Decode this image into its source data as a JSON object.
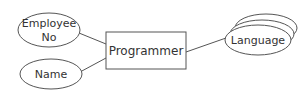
{
  "diagram": {
    "type": "er-diagram",
    "entity": {
      "label": "Programmer"
    },
    "attributes": [
      {
        "id": "employee-no",
        "label_line1": "Employee",
        "label_line2": "No",
        "kind": "attribute"
      },
      {
        "id": "name",
        "label": "Name",
        "kind": "attribute"
      },
      {
        "id": "language",
        "label": "Language",
        "kind": "multivalued-attribute"
      }
    ],
    "connections": [
      {
        "from": "Employee No",
        "to": "Programmer"
      },
      {
        "from": "Name",
        "to": "Programmer"
      },
      {
        "from": "Programmer",
        "to": "Language"
      }
    ],
    "colors": {
      "stroke": "#555555",
      "text": "#333333",
      "background": "#ffffff"
    }
  }
}
